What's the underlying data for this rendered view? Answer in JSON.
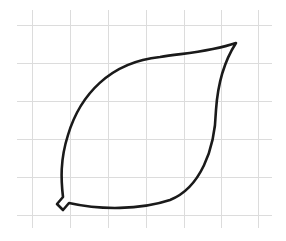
{
  "figure": {
    "background_color": "#ffffff",
    "grid": {
      "color": "#dcdcdc",
      "vertical_x": [
        32,
        70,
        108,
        146,
        184,
        221,
        258
      ],
      "horizontal_y": [
        25,
        63,
        101,
        139,
        177,
        215
      ],
      "extent": {
        "x_min": 17,
        "x_max": 272,
        "y_min": 10,
        "y_max": 228
      }
    },
    "leaf": {
      "stroke_color": "#1a1a1a",
      "path": "M 236 43 C 210 52, 185 53, 160 57 C 110 62, 80 95, 68 135 C 60 160, 61 180, 63 197 L 57 204 L 63 210 L 69 203 C 100 210, 140 210, 170 200 C 200 188, 215 150, 216 110 C 218 80, 225 60, 236 43 Z"
    }
  }
}
